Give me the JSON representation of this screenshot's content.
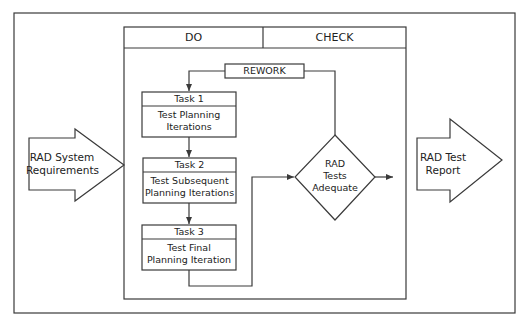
{
  "diagram": {
    "type": "flowchart",
    "colors": {
      "stroke": "#3a3a3a",
      "background": "#ffffff",
      "text": "#222222"
    },
    "columns": {
      "do_label": "DO",
      "check_label": "CHECK"
    },
    "input": {
      "line1": "RAD System",
      "line2": "Requirements"
    },
    "output": {
      "line1": "RAD Test",
      "line2": "Report"
    },
    "rework": {
      "label": "REWORK"
    },
    "tasks": [
      {
        "title": "Task 1",
        "line1": "Test Planning",
        "line2": "Iterations"
      },
      {
        "title": "Task 2",
        "line1": "Test Subsequent",
        "line2": "Planning Iterations"
      },
      {
        "title": "Task 3",
        "line1": "Test Final",
        "line2": "Planning Iteration"
      }
    ],
    "decision": {
      "line1": "RAD",
      "line2": "Tests",
      "line3": "Adequate"
    }
  }
}
